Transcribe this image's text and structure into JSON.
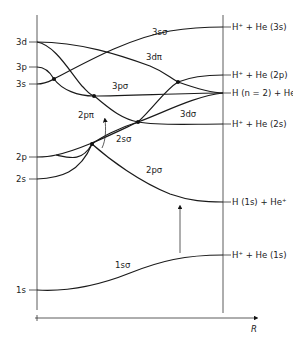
{
  "diagram": {
    "title": "",
    "type": "molecular orbital correlation diagram (HeH2+ / He+ + H)",
    "axis": {
      "x_label": "R",
      "left_axis": "united atom (He)",
      "right_axis": "separated atoms"
    },
    "left_levels": [
      {
        "label": "3d",
        "y": 42
      },
      {
        "label": "3p",
        "y": 67
      },
      {
        "label": "3s",
        "y": 84
      },
      {
        "label": "2p",
        "y": 157
      },
      {
        "label": "2s",
        "y": 179
      },
      {
        "label": "1s",
        "y": 290
      }
    ],
    "right_levels": [
      {
        "label": "H⁺ + He (3s)",
        "y": 27
      },
      {
        "label": "H⁺ + He (2p)",
        "y": 75
      },
      {
        "label": "H (n = 2) + He⁺",
        "y": 93
      },
      {
        "label": "H⁺ + He (2s)",
        "y": 124
      },
      {
        "label": "H (1s) + He⁺",
        "y": 202
      },
      {
        "label": "H⁺ + He (1s)",
        "y": 255
      }
    ],
    "orbital_labels": [
      {
        "label": "3sσ",
        "x": 152,
        "y": 35
      },
      {
        "label": "3dπ",
        "x": 146,
        "y": 60
      },
      {
        "label": "3pσ",
        "x": 112,
        "y": 89
      },
      {
        "label": "3dσ",
        "x": 180,
        "y": 117
      },
      {
        "label": "2pπ",
        "x": 78,
        "y": 118
      },
      {
        "label": "2sσ",
        "x": 116,
        "y": 142
      },
      {
        "label": "2pσ",
        "x": 146,
        "y": 173
      },
      {
        "label": "1sσ",
        "x": 115,
        "y": 268
      }
    ],
    "crossing_points": [
      {
        "x": 54,
        "y": 79
      },
      {
        "x": 94,
        "y": 96
      },
      {
        "x": 178,
        "y": 82
      },
      {
        "x": 138,
        "y": 122
      },
      {
        "x": 92,
        "y": 144
      }
    ],
    "arrows": [
      {
        "name": "radial-coupling-arrow",
        "from": [
          180,
          253
        ],
        "to": [
          180,
          204
        ]
      },
      {
        "name": "rotational-coupling-arrow",
        "from": [
          102,
          148
        ],
        "to": [
          105,
          118
        ]
      }
    ]
  }
}
